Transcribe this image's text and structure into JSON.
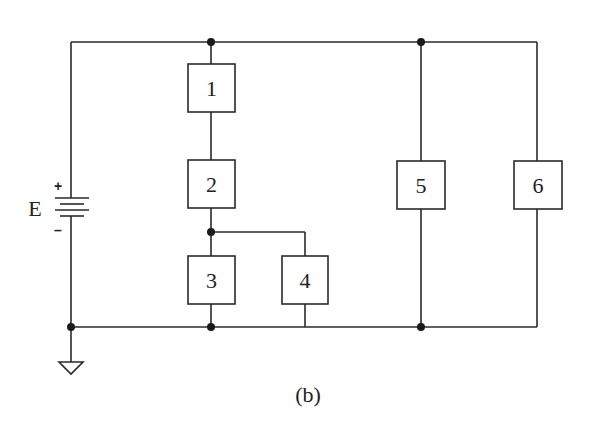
{
  "diagram": {
    "caption": "(b)",
    "source": {
      "label": "E",
      "plus": "+",
      "minus": "–"
    },
    "elements": [
      {
        "id": "1",
        "label": "1"
      },
      {
        "id": "2",
        "label": "2"
      },
      {
        "id": "3",
        "label": "3"
      },
      {
        "id": "4",
        "label": "4"
      },
      {
        "id": "5",
        "label": "5"
      },
      {
        "id": "6",
        "label": "6"
      }
    ],
    "colors": {
      "line": "#2a2a2a",
      "background": "#ffffff"
    }
  }
}
